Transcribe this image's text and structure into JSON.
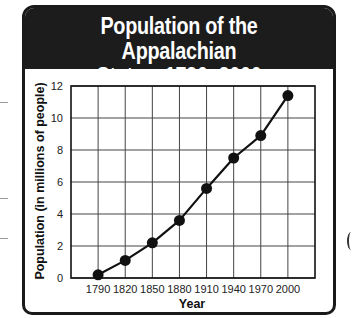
{
  "title": "Population of the Appalachian\nStates, 1790–2000",
  "colors": {
    "header_bg": "#1c1c1c",
    "header_text": "#ffffff",
    "line": "#111111",
    "grid": "#444444"
  },
  "chart_data": {
    "type": "line",
    "title": "Population of the Appalachian States, 1790–2000",
    "xlabel": "Year",
    "ylabel": "Population (in millions of people)",
    "categories": [
      "1790",
      "1820",
      "1850",
      "1880",
      "1910",
      "1940",
      "1970",
      "2000"
    ],
    "x": [
      1790,
      1820,
      1850,
      1880,
      1910,
      1940,
      1970,
      2000
    ],
    "series": [
      {
        "name": "Population",
        "values": [
          0.2,
          1.1,
          2.2,
          3.6,
          5.6,
          7.5,
          8.9,
          11.4
        ],
        "markers": true
      }
    ],
    "yticks": [
      0,
      2,
      4,
      6,
      8,
      10,
      12
    ],
    "ylim": [
      0,
      12
    ],
    "grid": true,
    "legend": null
  }
}
